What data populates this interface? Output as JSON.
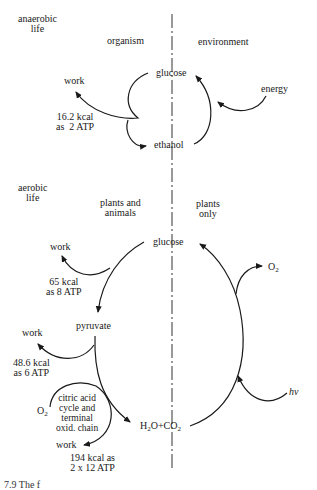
{
  "anaerobic": {
    "section_label": "anaerobic\nlife",
    "col_left": "organism",
    "col_right": "environment",
    "glucose": "glucose",
    "ethanol": "ethanol",
    "energy": "energy",
    "work": "work",
    "yield": "16.2 kcal\nas  2 ATP"
  },
  "aerobic": {
    "section_label": "aerobic\nlife",
    "col_left": "plants and\nanimals",
    "col_right": "plants\nonly",
    "glucose": "glucose",
    "pyruvate": "pyruvate",
    "work1": "work",
    "yield1": "65 kcal\nas 8 ATP",
    "work2": "work",
    "yield2": "48.6 kcal\nas 6 ATP",
    "cycle_label": "citric acid\ncycle and\nterminal\noxid. chain",
    "o2_in": "O",
    "o2_in_sub": "2",
    "work3": "work",
    "yield3": "194 kcal as\n2 x 12 ATP",
    "h2o": "H",
    "h2o_sub": "2",
    "h2o_rest": "O+CO",
    "co2_sub": "2",
    "o2_out": "O",
    "o2_out_sub": "2",
    "light": "hν"
  },
  "caption": "7.9    The f"
}
